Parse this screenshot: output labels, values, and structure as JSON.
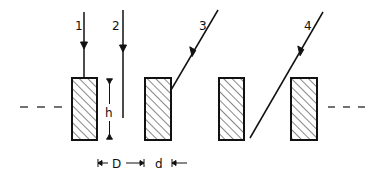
{
  "diagram": {
    "colors": {
      "stroke": "#111111",
      "background": "#ffffff"
    },
    "rays": [
      {
        "label": "1",
        "direction": "vertical"
      },
      {
        "label": "2",
        "direction": "vertical"
      },
      {
        "label": "3",
        "direction": "oblique"
      },
      {
        "label": "4",
        "direction": "oblique"
      }
    ],
    "blocks": {
      "count": 4,
      "fill": "hatched"
    },
    "dimensions": {
      "height": "h",
      "spacing": "D",
      "width": "d"
    },
    "continuation": {
      "left": "dashed",
      "right": "dashed"
    }
  }
}
